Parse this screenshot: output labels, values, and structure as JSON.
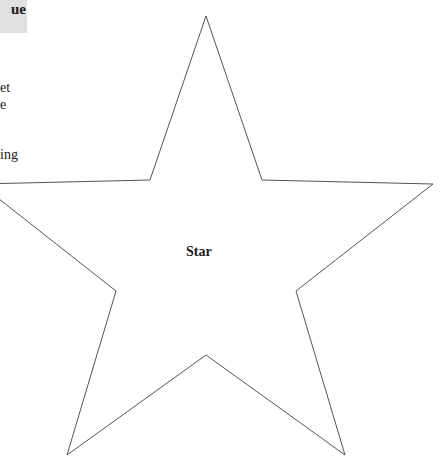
{
  "header": {
    "label_fragment": "ue"
  },
  "side_text": {
    "lines": [
      {
        "text": "et",
        "top": 80
      },
      {
        "text": "e",
        "top": 97
      },
      {
        "text": "ing",
        "top": 147
      }
    ]
  },
  "diagram": {
    "shape": "star",
    "label": "Star",
    "stroke_color": "#555555",
    "fill_color": "#ffffff",
    "points": "206,16 262,180 433,184 296,291 345,455 206,355 67,455 116,291 -20,184 150,180"
  }
}
